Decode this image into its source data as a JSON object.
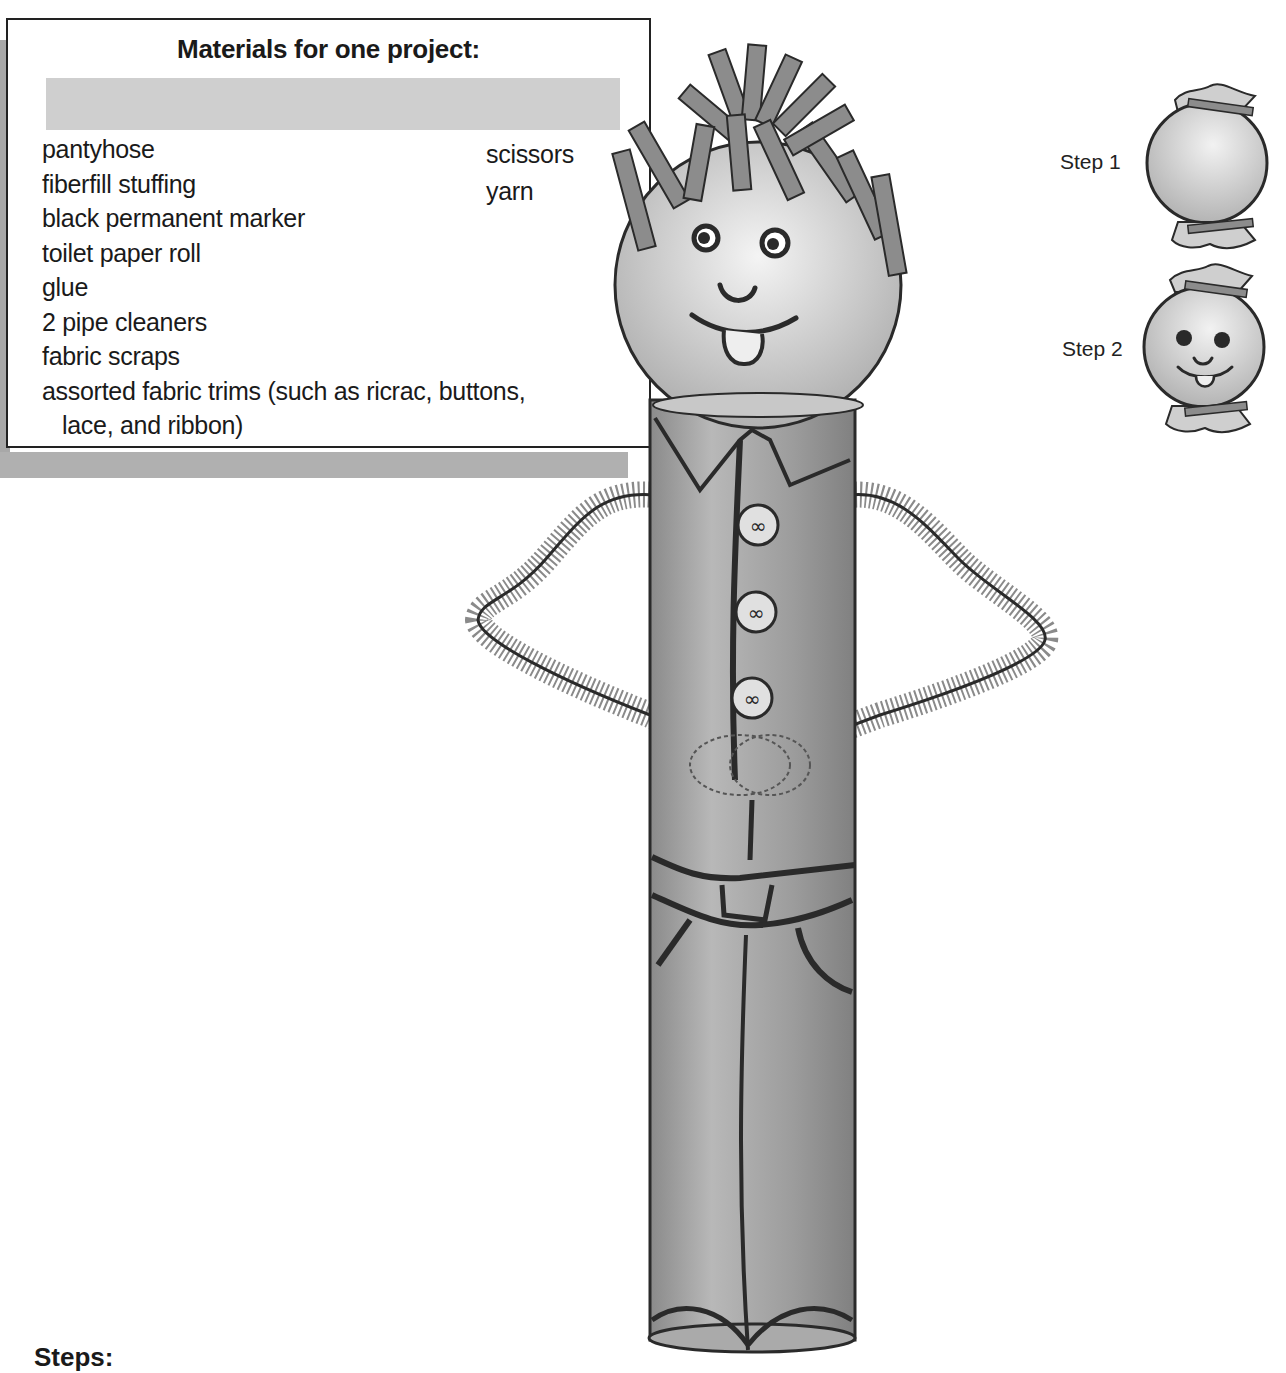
{
  "materials": {
    "title": "Materials for one project:",
    "items_left": [
      "pantyhose",
      "fiberfill stuffing",
      "black permanent marker",
      "toilet paper roll",
      "glue",
      "2 pipe cleaners",
      "fabric scraps"
    ],
    "item_wrapped_line1": "assorted fabric trims (such as ricrac, buttons,",
    "item_wrapped_line2": "lace, and ribbon)",
    "items_right": [
      "scissors",
      "yarn"
    ]
  },
  "steps_diagram": {
    "step1_label": "Step 1",
    "step2_label": "Step 2"
  },
  "steps_heading": "Steps:",
  "colors": {
    "outline": "#2a2a2a",
    "body_fill": "#9a9a9a",
    "head_fill": "#d6d6d6",
    "hair_fill": "#8c8c8c",
    "pipe_cleaner": "#7a7a7a"
  }
}
